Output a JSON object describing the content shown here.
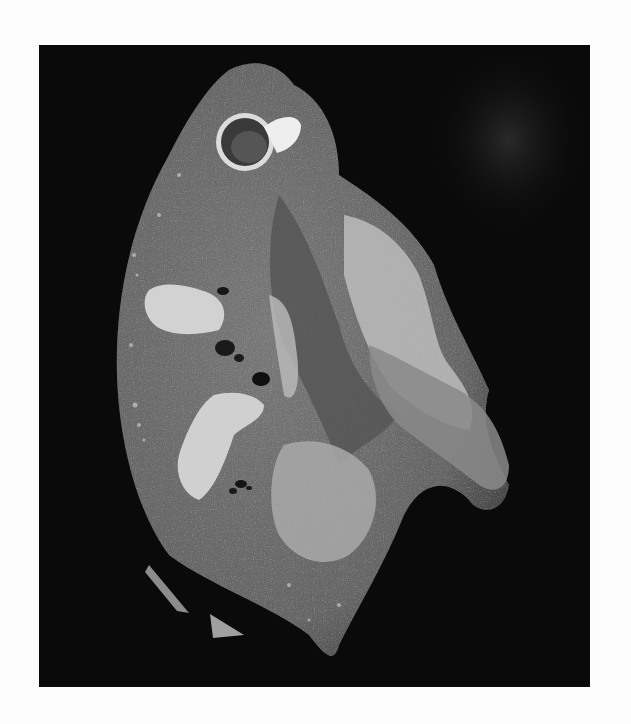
{
  "figure": {
    "alt": "Grayscale photograph of a sectioned organ specimen (cut surface with vessel lumens and pale fibrous/tumor-like areas) on a black background",
    "background_color": "#0a0a0a",
    "page_color": "#fdfdfd",
    "tissue_colors": {
      "parenchyma": "#6e6e6e",
      "parenchyma_dark": "#4f4f4f",
      "pale_lesion": "#c8c8c8",
      "highlight": "#e6e6e6",
      "lumen": "#111111"
    },
    "caption": ""
  }
}
